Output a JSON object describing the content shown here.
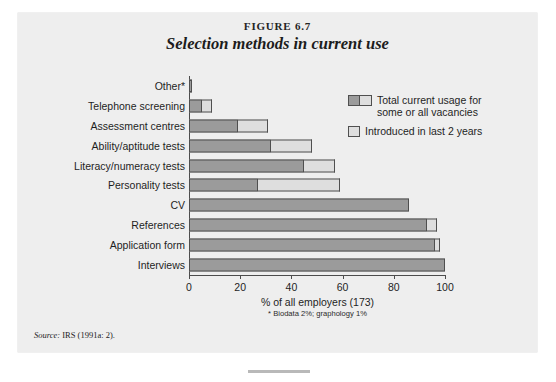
{
  "figure": {
    "number": "FIGURE 6.7",
    "title": "Selection methods in current use",
    "source_label": "Source:",
    "source_text": " IRS (1991a: 2)."
  },
  "colors": {
    "panel_background": "#eeeeee",
    "series_total": "#9b9b9b",
    "series_introduced": "#dedede",
    "outline": "#4f4f4f",
    "axis": "#4c4c4c",
    "text": "#1e1e1e"
  },
  "chart_data": {
    "type": "bar",
    "orientation": "horizontal",
    "stacked": true,
    "title": "Selection methods in current use",
    "subtitle": "FIGURE 6.7",
    "xlabel": "% of all employers (173)",
    "ylabel": "",
    "xlim": [
      0,
      100
    ],
    "xticks": [
      0,
      20,
      40,
      60,
      80,
      100
    ],
    "xtick_labels": [
      "0",
      "20",
      "40",
      "60",
      "80",
      "100"
    ],
    "grid": false,
    "legend_position": "top-right",
    "footnote": "* Biodata 2%; graphology 1%",
    "categories": [
      "Other*",
      "Telephone screening",
      "Assessment centres",
      "Ability/aptitude tests",
      "Literacy/numeracy tests",
      "Personality tests",
      "CV",
      "References",
      "Application form",
      "Interviews"
    ],
    "series": [
      {
        "name": "Total current usage for some or all vacancies",
        "values": [
          1,
          5,
          19,
          32,
          45,
          27,
          86,
          93,
          96,
          100
        ]
      },
      {
        "name": "Introduced in last 2 years",
        "values": [
          0,
          4,
          12,
          16,
          12,
          32,
          0,
          4,
          2,
          0
        ]
      }
    ],
    "totals": [
      1,
      9,
      31,
      48,
      57,
      59,
      86,
      97,
      98,
      100
    ]
  },
  "legend": {
    "entries": [
      {
        "label": "Total current usage for some or all vacancies",
        "swatch": "split-dark-light"
      },
      {
        "label": "Introduced in last 2 years",
        "swatch": "light"
      }
    ]
  }
}
